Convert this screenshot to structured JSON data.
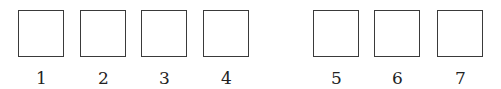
{
  "diagram": {
    "groups": [
      {
        "boxes": [
          {
            "label": "1",
            "x": 18
          },
          {
            "label": "2",
            "x": 80
          },
          {
            "label": "3",
            "x": 141
          },
          {
            "label": "4",
            "x": 203
          }
        ]
      },
      {
        "boxes": [
          {
            "label": "5",
            "x": 313
          },
          {
            "label": "6",
            "x": 374
          },
          {
            "label": "7",
            "x": 437
          }
        ]
      }
    ],
    "box_style": {
      "border_color": "#3a3a3a",
      "fill": "#ffffff"
    }
  }
}
